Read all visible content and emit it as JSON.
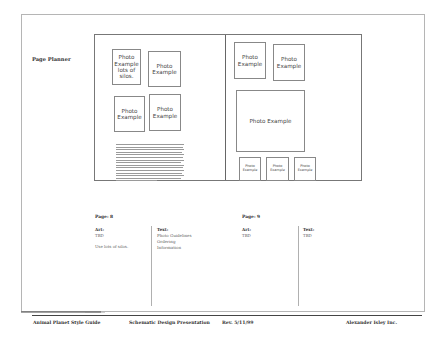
{
  "document": {
    "title": "Page Planner",
    "left_page": {
      "photos": [
        {
          "label": "Photo\nExample\nlots of\nsilos."
        },
        {
          "label": "Photo\nExample"
        },
        {
          "label": "Photo\nExample"
        },
        {
          "label": "Photo\nExample"
        }
      ],
      "page_label": "Page: 8",
      "art_label": "Art:",
      "art_value": "TBD",
      "art_note": "Use lots of silos.",
      "text_label": "Text:",
      "text_value": "Photo Guidelines\nOrdering\nInformation"
    },
    "right_page": {
      "photos": [
        {
          "label": "Photo\nExample"
        },
        {
          "label": "Photo\nExample"
        },
        {
          "label": "Photo Example"
        },
        {
          "label": "Photo\nExample"
        },
        {
          "label": "Photo\nExample"
        },
        {
          "label": "Photo\nExample"
        }
      ],
      "page_label": "Page: 9",
      "art_label": "Art:",
      "art_value": "TBD",
      "text_label": "Text:",
      "text_value": "TBD"
    },
    "footer": {
      "left": "Animal Planet Style Guide",
      "center": "Schematic Design Presentation",
      "rev": "Rev. 5/11/99",
      "right": "Alexander Isley Inc."
    }
  }
}
